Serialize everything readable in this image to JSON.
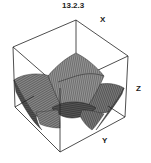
{
  "figure": {
    "label": "13.2.3",
    "type": "3d-surface-plot",
    "style": "wireframe mesh surface inside bounding box",
    "axes": {
      "x_label": "X",
      "y_label": "Y",
      "z_label": "Z"
    },
    "colors": {
      "box_edge": "#222222",
      "surface_dark": "#3a3a3a",
      "surface_mid": "#6a6a6a",
      "surface_light": "#9a9a9a",
      "background": "#ffffff"
    }
  }
}
